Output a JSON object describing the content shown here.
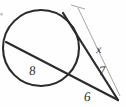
{
  "figure": {
    "kind": "geometry-diagram",
    "background_color": "#fefefe",
    "stroke_color": "#2b2b2b",
    "thin_stroke_color": "#9a9a9a",
    "width": 126,
    "height": 107
  },
  "circle": {
    "name": "main-circle",
    "center_x": 41,
    "center_y": 48,
    "radius": 38,
    "stroke_width": 2.1
  },
  "segments": [
    {
      "name": "chord-secant-lower",
      "label": "8",
      "x1": 6,
      "y1": 42,
      "x2": 118,
      "y2": 100,
      "stroke_width": 2.2
    },
    {
      "name": "secant-upper",
      "label": "7",
      "x1": 63,
      "y1": 13,
      "x2": 118,
      "y2": 100,
      "stroke_width": 2.2
    }
  ],
  "dimension_line": {
    "name": "x-dimension-line",
    "label": "x",
    "x1": 78,
    "y1": 8,
    "x2": 120,
    "y2": 96,
    "stroke_width": 0.9,
    "tick_x1": 71,
    "tick_y1": 5,
    "tick_x2": 85,
    "tick_y2": 9
  },
  "labels": [
    {
      "id": "label-8",
      "text": "8",
      "x": 29,
      "y": 64,
      "meaning": "chord-length-8"
    },
    {
      "id": "label-7",
      "text": "7",
      "x": 99,
      "y": 64,
      "meaning": "external-segment-7"
    },
    {
      "id": "label-6",
      "text": "6",
      "x": 84,
      "y": 90,
      "meaning": "external-segment-6"
    },
    {
      "id": "label-x",
      "text": "x",
      "x": 96,
      "y": 43,
      "meaning": "unknown-length-x"
    }
  ],
  "artifacts": [
    {
      "name": "scan-speck-left",
      "x": 1,
      "y": 14,
      "size": 2
    }
  ]
}
